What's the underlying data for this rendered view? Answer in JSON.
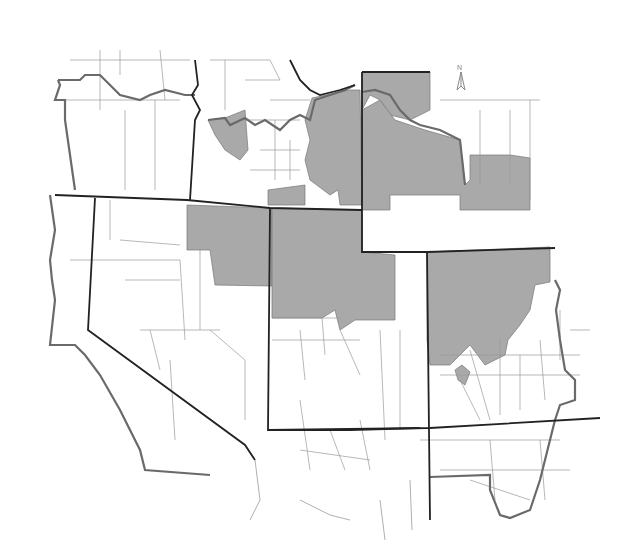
{
  "map": {
    "title": "",
    "north_arrow": {
      "label": "N",
      "icon": "north-arrow-icon"
    },
    "colors": {
      "background": "#ffffff",
      "shaded_region": "#a9a9a9",
      "state_border": "#222222",
      "outer_border": "#6a6a6a",
      "county_border": "#9a9a9a"
    },
    "legend": []
  }
}
